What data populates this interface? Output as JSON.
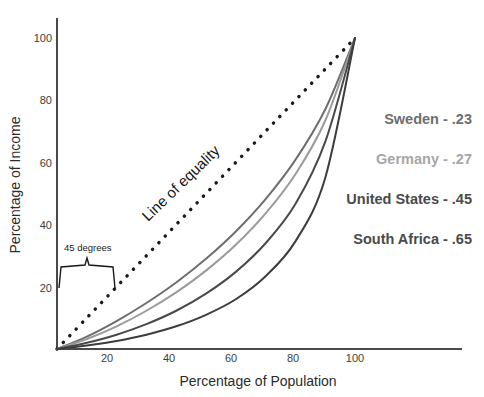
{
  "chart_data": {
    "type": "line",
    "title": "",
    "xlabel": "Percentage of Population",
    "ylabel": "Percentage of Income",
    "xlim": [
      0,
      120
    ],
    "ylim": [
      0,
      108
    ],
    "xticks": [
      "20",
      "40",
      "60",
      "80",
      "100"
    ],
    "xtick_values": [
      20,
      40,
      60,
      80,
      100
    ],
    "yticks": [
      "20",
      "40",
      "60",
      "80",
      "100"
    ],
    "ytick_values": [
      20,
      40,
      60,
      80,
      100
    ],
    "grid": false,
    "legend_position": "right",
    "annotations": [
      {
        "id": "equality",
        "text": "Line of equality",
        "rotation": -45
      },
      {
        "id": "degrees",
        "text": "45 degrees"
      }
    ],
    "series": [
      {
        "name": "Line of equality",
        "style": "dotted",
        "color": "#1a1a1a",
        "gini": null,
        "x": [
          0,
          10,
          20,
          30,
          40,
          50,
          60,
          70,
          80,
          90,
          100
        ],
        "values": [
          0,
          10,
          20,
          30,
          40,
          50,
          60,
          70,
          80,
          90,
          100
        ]
      },
      {
        "name": "Sweden",
        "label": "Sweden - .23",
        "gini": ".23",
        "color": "#6e6e6e",
        "x": [
          0,
          10,
          20,
          30,
          40,
          50,
          60,
          70,
          80,
          90,
          100
        ],
        "values": [
          0,
          4.0,
          9.0,
          14.8,
          21.4,
          29.0,
          37.8,
          48.2,
          60.8,
          77.0,
          100
        ]
      },
      {
        "name": "Germany",
        "label": "Germany - .27",
        "gini": ".27",
        "color": "#9a9a9a",
        "x": [
          0,
          10,
          20,
          30,
          40,
          50,
          60,
          70,
          80,
          90,
          100
        ],
        "values": [
          0,
          3.2,
          7.3,
          12.3,
          18.2,
          25.2,
          33.5,
          43.6,
          56.2,
          73.4,
          100
        ]
      },
      {
        "name": "United States",
        "label": "United States - .45",
        "gini": ".45",
        "color": "#4a4a4a",
        "x": [
          0,
          10,
          20,
          30,
          40,
          50,
          60,
          70,
          80,
          90,
          100
        ],
        "values": [
          0,
          2.0,
          4.6,
          8.0,
          12.3,
          17.8,
          24.8,
          34.0,
          46.6,
          66.6,
          100
        ]
      },
      {
        "name": "South Africa",
        "label": "South Africa - .65",
        "gini": ".65",
        "color": "#3d3d3d",
        "x": [
          0,
          10,
          20,
          30,
          40,
          50,
          60,
          70,
          80,
          90,
          100
        ],
        "values": [
          0,
          1.1,
          2.6,
          4.6,
          7.3,
          11.0,
          16.0,
          23.4,
          34.6,
          55.0,
          100
        ]
      }
    ]
  },
  "legend": {
    "items": [
      {
        "label": "Sweden - .23",
        "color": "#6e6e6e"
      },
      {
        "label": "Germany - .27",
        "color": "#a6a6a6"
      },
      {
        "label": "United States - .45",
        "color": "#4a4a4a"
      },
      {
        "label": "South Africa - .65",
        "color": "#4a4a4a"
      }
    ]
  },
  "axes": {
    "x_title": "Percentage of Population",
    "y_title": "Percentage of Income"
  },
  "annotations": {
    "equality_label": "Line of equality",
    "degrees_label": "45 degrees"
  },
  "colors": {
    "axis": "#4a4a4a",
    "text": "#2b2b2b",
    "sweden": "#6e6e6e",
    "germany": "#9a9a9a",
    "united_states": "#4a4a4a",
    "south_africa": "#3d3d3d",
    "equality": "#1a1a1a"
  }
}
